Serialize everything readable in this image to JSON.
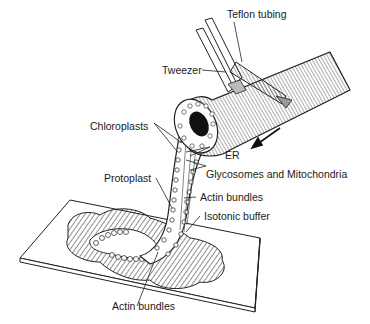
{
  "diagram": {
    "labels": {
      "teflon_tubing": "Teflon tubing",
      "tweezer": "Tweezer",
      "chloroplasts": "Chloroplasts",
      "er": "ER",
      "glycosomes": "Glycosomes and Mitochondria",
      "protoplast": "Protoplast",
      "actin_upper": "Actin bundles",
      "isotonic_buffer": "Isotonic buffer",
      "actin_lower": "Actin bundles"
    },
    "colors": {
      "ink": "#1a1a1a",
      "paper": "#ffffff"
    }
  }
}
